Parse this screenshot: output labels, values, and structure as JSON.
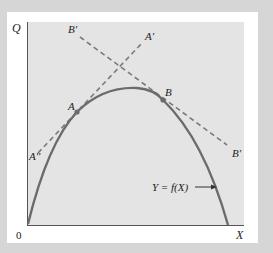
{
  "diagram": {
    "type": "production-possibility-curve",
    "axes": {
      "y_label": "Q",
      "x_label": "X",
      "origin_label": "0"
    },
    "curve": {
      "label": "Y = f(X)",
      "label_parts": {
        "y": "Y",
        "eq": "=",
        "f": "f",
        "arg": "(X)"
      }
    },
    "points": [
      {
        "id": "A",
        "label": "A"
      },
      {
        "id": "B",
        "label": "B"
      }
    ],
    "tangent_lines": [
      {
        "id": "A-line",
        "start_label": "A''",
        "end_label": "A'",
        "style": "dashed",
        "touches": "A"
      },
      {
        "id": "B-line",
        "start_label": "B'",
        "end_label": "B'",
        "style": "dashed",
        "touches": "B"
      }
    ],
    "colors": {
      "outer_background": "#d6d6d6",
      "panel": "#ffffff",
      "plot_area": "#e4e4e4",
      "curve": "#6b6b6b",
      "dashed_lines": "#7a7a7a",
      "axis": "#555555",
      "text": "#222222"
    }
  }
}
